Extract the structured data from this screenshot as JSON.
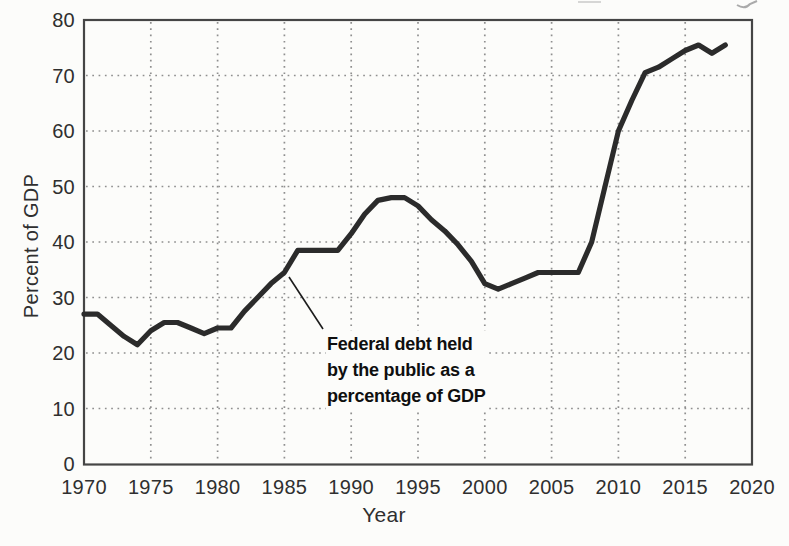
{
  "figure": {
    "ylabel": "Percent of GDP",
    "xlabel": "Year",
    "annotation": {
      "lines": [
        "Federal debt held",
        "by the public as a",
        "percentage of GDP"
      ]
    }
  },
  "chart_data": {
    "type": "line",
    "title": "",
    "xlabel": "Year",
    "ylabel": "Percent of GDP",
    "xlim": [
      1970,
      2020
    ],
    "ylim": [
      0,
      80
    ],
    "x_ticks": [
      1970,
      1975,
      1980,
      1985,
      1990,
      1995,
      2000,
      2005,
      2010,
      2015,
      2020
    ],
    "y_ticks": [
      0,
      10,
      20,
      30,
      40,
      50,
      60,
      70,
      80
    ],
    "grid": "dotted",
    "legend_position": "none",
    "series": [
      {
        "name": "Federal debt held by the public as a percentage of GDP",
        "color": "#2b2b2b",
        "x": [
          1970,
          1971,
          1972,
          1973,
          1974,
          1975,
          1976,
          1977,
          1978,
          1979,
          1980,
          1981,
          1982,
          1983,
          1984,
          1985,
          1986,
          1987,
          1988,
          1989,
          1990,
          1991,
          1992,
          1993,
          1994,
          1995,
          1996,
          1997,
          1998,
          1999,
          2000,
          2001,
          2002,
          2003,
          2004,
          2005,
          2006,
          2007,
          2008,
          2009,
          2010,
          2011,
          2012,
          2013,
          2014,
          2015,
          2016,
          2017,
          2018
        ],
        "values": [
          27,
          27,
          25,
          23,
          21.5,
          24,
          25.5,
          25.5,
          24.5,
          23.5,
          24.5,
          24.5,
          27.5,
          30,
          32.5,
          34.5,
          38.5,
          38.5,
          38.5,
          38.5,
          41.5,
          45,
          47.5,
          48,
          48,
          46.5,
          44,
          42,
          39.5,
          36.5,
          32.5,
          31.5,
          32.5,
          33.5,
          34.5,
          34.5,
          34.5,
          34.5,
          40,
          50,
          60,
          65.5,
          70.5,
          71.5,
          73,
          74.5,
          75.5,
          74,
          75.5
        ]
      }
    ],
    "annotation": {
      "text": "Federal debt held by the public as a percentage of GDP",
      "attach_year": 1985.3,
      "attach_value": 34
    }
  },
  "colors": {
    "line": "#2b2b2b",
    "grid": "#8f8f8f",
    "frame": "#454545",
    "text": "#2f2f2f",
    "annotation_text": "#0f0f0f",
    "background": "#fcfcfa"
  }
}
